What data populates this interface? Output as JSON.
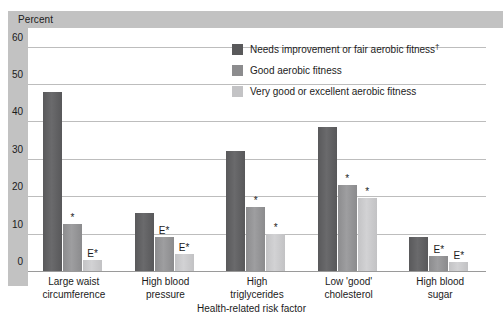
{
  "chart_data": {
    "type": "bar",
    "title": "",
    "xlabel": "Health-related risk factor",
    "ylabel": "Percent",
    "ylim": [
      0,
      65
    ],
    "yticks": [
      0,
      10,
      20,
      30,
      40,
      50,
      60
    ],
    "grid": true,
    "legend_position": "top-right",
    "categories": [
      "Large waist circumference",
      "High blood pressure",
      "High triglycerides",
      "Low 'good' cholesterol",
      "High blood sugar"
    ],
    "category_lines": [
      [
        "Large waist",
        "circumference"
      ],
      [
        "High blood",
        "pressure"
      ],
      [
        "High",
        "triglycerides"
      ],
      [
        "Low 'good'",
        "cholesterol"
      ],
      [
        "High blood",
        "sugar"
      ]
    ],
    "series": [
      {
        "name": "Needs improvement or fair aerobic fitness",
        "name_dagger": "†",
        "color": "#59595b",
        "values": [
          48.0,
          15.5,
          32.0,
          38.5,
          9.0
        ],
        "notes": [
          "",
          "",
          "",
          "",
          ""
        ]
      },
      {
        "name": "Good aerobic fitness",
        "color": "#8c8c8e",
        "values": [
          12.5,
          9.0,
          17.0,
          23.0,
          4.0
        ],
        "notes": [
          "*",
          "E*",
          "*",
          "*",
          "E*"
        ]
      },
      {
        "name": "Very good or excellent aerobic fitness",
        "color": "#c3c3c5",
        "values": [
          3.0,
          4.5,
          10.0,
          19.5,
          2.5
        ],
        "notes": [
          "E*",
          "E*",
          "*",
          "*",
          "E*"
        ]
      }
    ]
  },
  "legend": {
    "items": [
      {
        "label": "Needs improvement or fair aerobic fitness",
        "dagger": "†"
      },
      {
        "label": "Good aerobic fitness",
        "dagger": ""
      },
      {
        "label": "Very good or excellent aerobic fitness",
        "dagger": ""
      }
    ]
  }
}
